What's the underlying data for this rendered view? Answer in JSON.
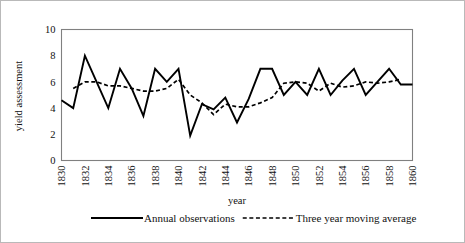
{
  "chart_data": {
    "type": "line",
    "title": "",
    "xlabel": "year",
    "ylabel": "yield assessment",
    "xlim": [
      1830,
      1860
    ],
    "ylim": [
      0,
      10
    ],
    "ytick_labels": [
      "0",
      "2",
      "4",
      "6",
      "8",
      "10"
    ],
    "yticks": [
      0,
      2,
      4,
      6,
      8,
      10
    ],
    "xtick_labels": [
      "1830",
      "1832",
      "1834",
      "1836",
      "1838",
      "1840",
      "1842",
      "1844",
      "1846",
      "1848",
      "1850",
      "1852",
      "1854",
      "1856",
      "1858",
      "1860"
    ],
    "xticks": [
      1830,
      1832,
      1834,
      1836,
      1838,
      1840,
      1842,
      1844,
      1846,
      1848,
      1850,
      1852,
      1854,
      1856,
      1858,
      1860
    ],
    "grid": true,
    "legend_position": "bottom",
    "x": [
      1830,
      1831,
      1832,
      1833,
      1834,
      1835,
      1836,
      1837,
      1838,
      1839,
      1840,
      1841,
      1842,
      1843,
      1844,
      1845,
      1846,
      1847,
      1848,
      1849,
      1850,
      1851,
      1852,
      1853,
      1854,
      1855,
      1856,
      1857,
      1858,
      1859,
      1860
    ],
    "series": [
      {
        "name": "Annual observations",
        "style": "solid",
        "values": [
          4.6,
          4.0,
          8.0,
          6.0,
          4.0,
          7.0,
          5.5,
          3.4,
          7.0,
          6.0,
          7.0,
          1.9,
          4.3,
          3.9,
          4.8,
          2.9,
          4.7,
          7.0,
          7.0,
          5.0,
          6.0,
          5.0,
          7.0,
          5.0,
          6.1,
          7.0,
          5.0,
          6.0,
          7.0,
          5.8,
          5.8
        ]
      },
      {
        "name": "Three year moving average",
        "style": "dashed",
        "values": [
          null,
          5.5,
          6.0,
          6.0,
          5.7,
          5.7,
          5.5,
          5.3,
          5.3,
          5.5,
          6.2,
          5.0,
          4.4,
          3.5,
          4.3,
          4.1,
          4.1,
          4.4,
          4.8,
          5.9,
          6.0,
          5.9,
          5.3,
          5.9,
          5.6,
          5.7,
          6.0,
          5.9,
          6.0,
          6.2,
          null
        ]
      }
    ]
  },
  "legend": {
    "entries": [
      {
        "label": "Annual observations",
        "style": "solid"
      },
      {
        "label": "Three year moving average",
        "style": "dashed"
      }
    ]
  },
  "axes": {
    "x_title": "year",
    "y_title": "yield assessment"
  },
  "colors": {
    "series": "#000000",
    "frame": "#808080",
    "grid": "#eceef2",
    "outer_border": "#b9b9b9",
    "background": "#ffffff"
  }
}
